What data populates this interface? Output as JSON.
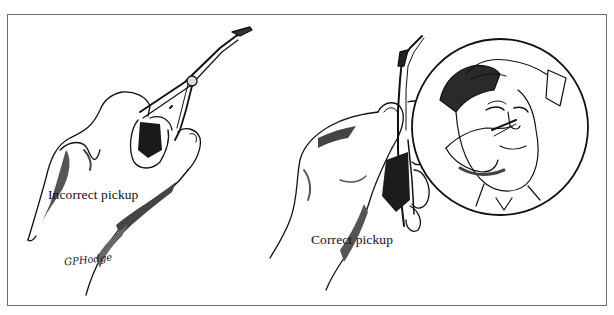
{
  "figure": {
    "panels": [
      {
        "id": "incorrect",
        "caption": "Incorrect pickup",
        "description": "hand gripping forceps with fingers wrapped around the hinge"
      },
      {
        "id": "correct",
        "caption": "Correct pickup",
        "description": "hand holding forceps like a pencil between thumb and fingers"
      }
    ],
    "inset": {
      "description": "circular inset showing forceps inserted into a patient's nostril while another hand holds the forehead"
    },
    "signature": "GPHodge",
    "colors": {
      "ink": "#111111",
      "shade": "#555555",
      "light_shade": "#9a9a9a",
      "frame": "#6e6e6e",
      "paper": "#ffffff"
    }
  }
}
